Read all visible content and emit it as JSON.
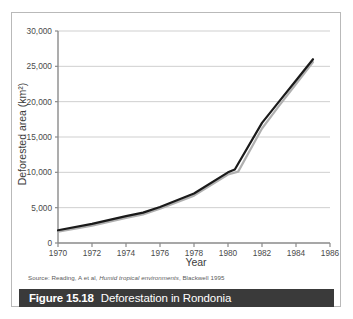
{
  "figure": {
    "caption_number": "Figure 15.18",
    "caption_title": "Deforestation in Rondonia",
    "source": "Source: Reading, A et al, Humid tropical environments, Blackwell 1995",
    "source_prefix": "Source: Reading, A et al, ",
    "source_italic": "Humid tropical environments",
    "source_suffix": ", Blackwell 1995",
    "caption_bar_color": "#3a3a3a",
    "frame_color": "#b9b9b9"
  },
  "chart_data": {
    "type": "line",
    "title": "",
    "xlabel": "Year",
    "ylabel": "Deforested area (km²)",
    "xlim": [
      1970,
      1986
    ],
    "ylim": [
      0,
      30000
    ],
    "xticks": [
      1970,
      1972,
      1974,
      1976,
      1978,
      1980,
      1982,
      1984,
      1986
    ],
    "xticklabels": [
      "1970",
      "1972",
      "1974",
      "1976",
      "1978",
      "1980",
      "1982",
      "1984",
      "1986"
    ],
    "yticks": [
      0,
      5000,
      10000,
      15000,
      20000,
      25000,
      30000
    ],
    "yticklabels": [
      "0",
      "5,000",
      "10,000",
      "15,000",
      "20,000",
      "25,000",
      "30,000"
    ],
    "grid": true,
    "grid_axis": "y",
    "grid_color": "#cfcfcf",
    "legend": false,
    "series": [
      {
        "name": "Deforested area",
        "color": "#1a1a1a",
        "width": 2.2,
        "x": [
          1970,
          1972,
          1974,
          1975,
          1976,
          1978,
          1980,
          1980.4,
          1982,
          1983,
          1984,
          1985
        ],
        "values": [
          1800,
          2700,
          3800,
          4300,
          5100,
          7000,
          10000,
          10400,
          17000,
          20000,
          23000,
          26000
        ]
      },
      {
        "name": "Deforested area (shadow)",
        "color": "#b0b0b0",
        "width": 2.2,
        "x": [
          1970,
          1972,
          1974,
          1975,
          1976,
          1978,
          1980,
          1980.6,
          1982,
          1983,
          1984,
          1985
        ],
        "values": [
          1600,
          2450,
          3550,
          4050,
          4850,
          6700,
          9700,
          10100,
          16200,
          19400,
          22500,
          25600
        ]
      }
    ]
  }
}
